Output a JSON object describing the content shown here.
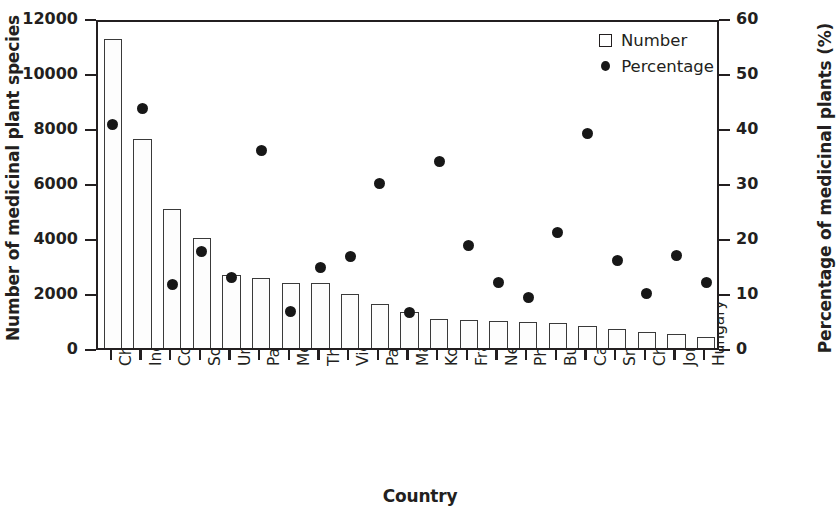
{
  "chart_data": {
    "type": "bar",
    "title": "",
    "xlabel": "Country",
    "ylabel": "Number of medicinal plant species",
    "ylabel_right": "Percentage of medicinal plants (%)",
    "ylim": [
      0,
      12000
    ],
    "ylim_right": [
      0,
      60
    ],
    "yticks": [
      "0",
      "2000",
      "4000",
      "6000",
      "8000",
      "10000",
      "12000"
    ],
    "ytick_values": [
      0,
      2000,
      4000,
      6000,
      8000,
      10000,
      12000
    ],
    "yticks_right": [
      "0",
      "10",
      "20",
      "30",
      "40",
      "50",
      "60"
    ],
    "ytick_values_right": [
      0,
      10,
      20,
      30,
      40,
      50,
      60
    ],
    "grid": false,
    "legend_position": "top-right",
    "categories": [
      "China",
      "India",
      "Colombia",
      "Southern Africa",
      "United States",
      "Paraguay",
      "Mexico",
      "Thailand",
      "Vietnam",
      "Pakistan",
      "Malaysia",
      "Korea",
      "France",
      "Nepal",
      "Philippines",
      "Bulgaria",
      "Canarian",
      "Sri Lanka",
      "Chile",
      "Jordan",
      "Hungary"
    ],
    "series": [
      {
        "name": "Number",
        "axis": "left",
        "marker": "open-square",
        "values": [
          11250,
          7600,
          5050,
          4000,
          2650,
          2550,
          2350,
          2350,
          1950,
          1600,
          1300,
          1050,
          1020,
          1000,
          950,
          900,
          800,
          700,
          600,
          500,
          400
        ]
      },
      {
        "name": "Percentage",
        "axis": "right",
        "marker": "filled-circle",
        "values": [
          41.3,
          44.3,
          12.2,
          18.3,
          13.5,
          36.7,
          7.4,
          15.4,
          17.4,
          30.6,
          7.1,
          34.7,
          19.4,
          12.6,
          9.9,
          21.7,
          39.8,
          16.6,
          10.6,
          17.6,
          12.6
        ]
      }
    ]
  },
  "legend": {
    "items": [
      {
        "label": "Number",
        "marker": "open-square"
      },
      {
        "label": "Percentage",
        "marker": "filled-circle"
      }
    ]
  }
}
